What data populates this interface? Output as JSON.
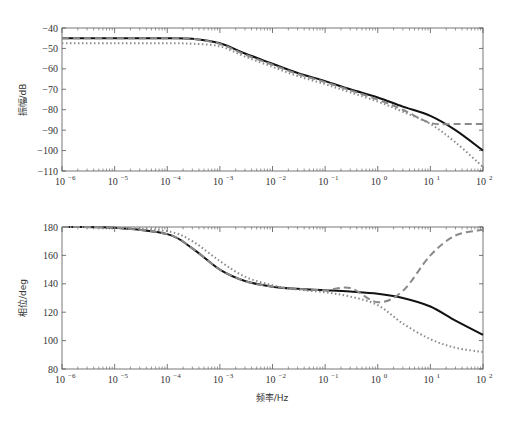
{
  "chart_data": [
    {
      "type": "line",
      "title": "",
      "xlabel": "",
      "ylabel": "振幅/dB",
      "xscale": "log",
      "xlim": [
        1e-06,
        100
      ],
      "ylim": [
        -110,
        -40
      ],
      "xticks": [
        "10^-6",
        "10^-5",
        "10^-4",
        "10^-3",
        "10^-2",
        "10^-1",
        "10^0",
        "10^1",
        "10^2"
      ],
      "yticks": [
        -40,
        -50,
        -60,
        -70,
        -80,
        -90,
        -100,
        -110
      ],
      "grid": false,
      "legend": "none",
      "x": [
        1e-06,
        1e-05,
        0.0001,
        0.0003,
        0.001,
        0.003,
        0.01,
        0.03,
        0.1,
        0.3,
        1,
        3,
        10,
        30,
        100
      ],
      "series": [
        {
          "name": "solid-black",
          "style": "solid",
          "color": "#111111",
          "values": [
            -45,
            -45,
            -45,
            -45.3,
            -47.5,
            -52.5,
            -57.5,
            -62,
            -66,
            -70,
            -74,
            -78.5,
            -83,
            -90,
            -100
          ]
        },
        {
          "name": "dashed-gray",
          "style": "dashed",
          "color": "#888888",
          "values": [
            -45,
            -45,
            -45,
            -45.3,
            -47.8,
            -53,
            -58,
            -62.5,
            -66.5,
            -70.5,
            -75,
            -80,
            -86.5,
            -87,
            -87
          ]
        },
        {
          "name": "dotted-gray",
          "style": "dotted",
          "color": "#888888",
          "values": [
            -47.5,
            -47.5,
            -47.5,
            -47.7,
            -49,
            -54,
            -59,
            -63.5,
            -67.5,
            -71.5,
            -76,
            -81,
            -87,
            -96,
            -108
          ]
        }
      ]
    },
    {
      "type": "line",
      "title": "",
      "xlabel": "频率/Hz",
      "ylabel": "相位/deg",
      "xscale": "log",
      "xlim": [
        1e-06,
        100
      ],
      "ylim": [
        80,
        180
      ],
      "xticks": [
        "10^-6",
        "10^-5",
        "10^-4",
        "10^-3",
        "10^-2",
        "10^-1",
        "10^0",
        "10^1",
        "10^2"
      ],
      "yticks": [
        180,
        160,
        140,
        120,
        100,
        80
      ],
      "grid": false,
      "legend": "none",
      "x": [
        1e-06,
        1e-05,
        0.0001,
        0.0003,
        0.001,
        0.003,
        0.01,
        0.03,
        0.1,
        0.3,
        1,
        3,
        10,
        30,
        100
      ],
      "series": [
        {
          "name": "solid-black",
          "style": "solid",
          "color": "#111111",
          "values": [
            180,
            179.5,
            175,
            165,
            150,
            142,
            138,
            136.5,
            135.5,
            134.5,
            133,
            130,
            124,
            114,
            104
          ]
        },
        {
          "name": "dashed-gray",
          "style": "dashed",
          "color": "#888888",
          "values": [
            180,
            179.5,
            175,
            165,
            150,
            142,
            138,
            136.5,
            135.5,
            137,
            127,
            135,
            160,
            174,
            178
          ]
        },
        {
          "name": "dotted-gray",
          "style": "dotted",
          "color": "#888888",
          "values": [
            180,
            179.5,
            177,
            170,
            156,
            145,
            139,
            136,
            134,
            131,
            125,
            112,
            101,
            95,
            92
          ]
        }
      ]
    }
  ],
  "top_chart": {
    "ylabel": "振幅/dB",
    "yticks": [
      "-40",
      "-50",
      "-60",
      "-70",
      "-80",
      "-90",
      "-100",
      "-110"
    ]
  },
  "bottom_chart": {
    "ylabel": "相位/deg",
    "xlabel": "频率/Hz",
    "yticks": [
      "180",
      "160",
      "140",
      "120",
      "100",
      "80"
    ]
  },
  "xtick_bases": [
    "10",
    "10",
    "10",
    "10",
    "10",
    "10",
    "10",
    "10",
    "10"
  ],
  "xtick_exps": [
    "−6",
    "−5",
    "−4",
    "−3",
    "−2",
    "−1",
    "0",
    "1",
    "2"
  ],
  "colors": {
    "axis": "#555555",
    "solid": "#111111",
    "gray": "#8a8a8a"
  }
}
